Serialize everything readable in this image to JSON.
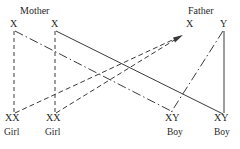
{
  "diagram": {
    "title_hidden": "",
    "type": "sex-determination-punnett-cross",
    "colors": {
      "line": "#3a3a3a",
      "text": "#1f1f1f",
      "background": "#ffffff"
    },
    "parents": [
      {
        "id": "mother",
        "label": "Mother",
        "x": 20,
        "y": 6
      },
      {
        "id": "father",
        "label": "Father",
        "x": 188,
        "y": 6
      }
    ],
    "alleles": [
      {
        "id": "mother-x1",
        "label": "X",
        "x": 10,
        "y": 19
      },
      {
        "id": "mother-x2",
        "label": "X",
        "x": 51,
        "y": 19
      },
      {
        "id": "father-x",
        "label": "X",
        "x": 186,
        "y": 19
      },
      {
        "id": "father-y",
        "label": "Y",
        "x": 220,
        "y": 19
      }
    ],
    "offspring": [
      {
        "id": "child-1",
        "genotype": "XX",
        "sex": "Girl",
        "gx": 5,
        "gy": 113,
        "sx": 4,
        "sy": 128
      },
      {
        "id": "child-2",
        "genotype": "XX",
        "sex": "Girl",
        "gx": 46,
        "gy": 113,
        "sx": 45,
        "sy": 128
      },
      {
        "id": "child-3",
        "genotype": "XY",
        "sex": "Boy",
        "gx": 165,
        "gy": 113,
        "sx": 167,
        "sy": 128
      },
      {
        "id": "child-4",
        "genotype": "XY",
        "sex": "Boy",
        "gx": 214,
        "gy": 113,
        "sx": 214,
        "sy": 128
      }
    ],
    "edges": [
      {
        "id": "edge-mother-x1-to-child1",
        "style": "dashed",
        "from": "mother-x1",
        "to": "child-1",
        "x1": 14,
        "y1": 31,
        "x2": 14,
        "y2": 112
      },
      {
        "id": "edge-mother-x2-to-child2",
        "style": "dashed",
        "from": "mother-x2",
        "to": "child-2",
        "x1": 55,
        "y1": 31,
        "x2": 55,
        "y2": 112
      },
      {
        "id": "edge-mother-x1-to-child3",
        "style": "dashdot",
        "from": "mother-x1",
        "to": "child-3",
        "x1": 15,
        "y1": 31,
        "x2": 173,
        "y2": 112
      },
      {
        "id": "edge-mother-x2-to-child4",
        "style": "solid",
        "from": "mother-x2",
        "to": "child-4",
        "x1": 56,
        "y1": 31,
        "x2": 223,
        "y2": 114
      },
      {
        "id": "edge-child1-to-father-x",
        "style": "dashed",
        "from": "child-1",
        "to": "father-x",
        "x1": 15,
        "y1": 113,
        "x2": 181,
        "y2": 36,
        "arrow": true
      },
      {
        "id": "edge-child2-to-father-x",
        "style": "dashed",
        "from": "child-2",
        "to": "father-x",
        "x1": 56,
        "y1": 113,
        "x2": 181,
        "y2": 36,
        "arrow": true
      },
      {
        "id": "edge-father-y-to-child3",
        "style": "dashdot",
        "from": "father-y",
        "to": "child-3",
        "x1": 223,
        "y1": 31,
        "x2": 170,
        "y2": 114
      },
      {
        "id": "edge-father-y-to-child4",
        "style": "solid",
        "from": "father-y",
        "to": "child-4",
        "x1": 224,
        "y1": 31,
        "x2": 224,
        "y2": 113
      }
    ],
    "arrowhead": {
      "id": "arrow-to-father-x",
      "x": 181,
      "y": 36,
      "angle": -25
    }
  }
}
